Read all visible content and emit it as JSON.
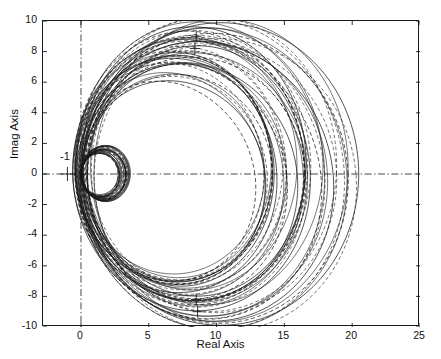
{
  "figure": {
    "kind": "nyquist-plot",
    "caption": ""
  },
  "axes": {
    "xlabel": "Real Axis",
    "ylabel": "Imag Axis",
    "xticks": [
      "0",
      "5",
      "10",
      "15",
      "20",
      "25"
    ],
    "xtick_values": [
      0,
      5,
      10,
      15,
      20,
      25
    ],
    "yticks": [
      "10",
      "8",
      "6",
      "4",
      "2",
      "0",
      "-2",
      "-4",
      "-6",
      "-8",
      "-10"
    ],
    "ytick_values": [
      10,
      8,
      6,
      4,
      2,
      0,
      -2,
      -4,
      -6,
      -8,
      -10
    ],
    "xlim": [
      -2.8,
      25
    ],
    "ylim": [
      -10,
      10
    ],
    "grid": false,
    "box": true
  },
  "annotations": {
    "critical_point_label": "-1",
    "critical_point": [
      -1,
      0
    ]
  },
  "colors": {
    "line": "#1a1a1a",
    "axis": "#1a1a1a",
    "background": "#ffffff"
  },
  "chart_data": {
    "type": "line",
    "title": "",
    "xlabel": "Real Axis",
    "ylabel": "Imag Axis",
    "xlim": [
      -2.8,
      25
    ],
    "ylim": [
      -10,
      10
    ],
    "grid": false,
    "legend": null,
    "annotations": [
      {
        "text": "-1",
        "x": -1,
        "y": 0,
        "marker": "plus"
      },
      {
        "marker": "plus",
        "x": 8.5,
        "y": 9.0
      },
      {
        "marker": "plus",
        "x": 8.4,
        "y": 8.2
      },
      {
        "marker": "plus",
        "x": 8.5,
        "y": -8.2
      },
      {
        "marker": "plus",
        "x": 8.6,
        "y": -9.0
      }
    ],
    "reference_lines": [
      {
        "orientation": "vertical",
        "value": 0,
        "style": "dashdot"
      },
      {
        "orientation": "horizontal",
        "value": 0,
        "style": "dashdot"
      }
    ],
    "note": "Family of Nyquist loci: large near-circular contours passing through the origin with right-hand crossings from ~14 to ~20 on the real axis, plus a tight cluster of small circles near the origin spanning real ~0 to ~3.6.",
    "series": [
      {
        "name": "locus-1",
        "style": "solid",
        "shape": "circle",
        "center": [
          10.0,
          0
        ],
        "radius": 10.0
      },
      {
        "name": "locus-2",
        "style": "dashed",
        "shape": "circle",
        "center": [
          9.6,
          0
        ],
        "radius": 9.6
      },
      {
        "name": "locus-3",
        "style": "solid",
        "shape": "circle",
        "center": [
          9.2,
          0
        ],
        "radius": 9.2
      },
      {
        "name": "locus-4",
        "style": "dashed",
        "shape": "circle",
        "center": [
          9.0,
          0
        ],
        "radius": 9.0
      },
      {
        "name": "locus-5",
        "style": "solid",
        "shape": "circle",
        "center": [
          8.8,
          0
        ],
        "radius": 8.8
      },
      {
        "name": "locus-6",
        "style": "dashed",
        "shape": "circle",
        "center": [
          8.6,
          0
        ],
        "radius": 8.6
      },
      {
        "name": "locus-7",
        "style": "solid",
        "shape": "circle",
        "center": [
          8.45,
          0
        ],
        "radius": 8.45
      },
      {
        "name": "locus-8",
        "style": "dashed",
        "shape": "circle",
        "center": [
          8.3,
          0
        ],
        "radius": 8.3
      },
      {
        "name": "locus-9",
        "style": "solid",
        "shape": "circle",
        "center": [
          8.15,
          0
        ],
        "radius": 8.15
      },
      {
        "name": "locus-10",
        "style": "dashed",
        "shape": "circle",
        "center": [
          8.0,
          0
        ],
        "radius": 8.0
      },
      {
        "name": "locus-11",
        "style": "solid",
        "shape": "circle",
        "center": [
          7.85,
          0
        ],
        "radius": 7.85
      },
      {
        "name": "locus-12",
        "style": "dashed",
        "shape": "circle",
        "center": [
          7.7,
          0
        ],
        "radius": 7.7
      },
      {
        "name": "locus-13",
        "style": "solid",
        "shape": "circle",
        "center": [
          7.55,
          0
        ],
        "radius": 7.55
      },
      {
        "name": "locus-14",
        "style": "dashed",
        "shape": "circle",
        "center": [
          7.4,
          0
        ],
        "radius": 7.4
      },
      {
        "name": "locus-15",
        "style": "solid",
        "shape": "circle",
        "center": [
          7.25,
          0
        ],
        "radius": 7.25
      },
      {
        "name": "locus-16",
        "style": "dashed",
        "shape": "circle",
        "center": [
          7.1,
          0
        ],
        "radius": 7.1
      },
      {
        "name": "locus-17",
        "style": "solid",
        "shape": "circle",
        "center": [
          6.95,
          0
        ],
        "radius": 6.95
      },
      {
        "name": "locus-18",
        "style": "dashed",
        "shape": "circle",
        "center": [
          6.8,
          0
        ],
        "radius": 6.8
      },
      {
        "name": "locus-19",
        "style": "solid",
        "shape": "circle",
        "center": [
          6.65,
          0
        ],
        "radius": 6.65
      },
      {
        "name": "locus-20",
        "style": "dashed",
        "shape": "circle",
        "center": [
          6.5,
          0
        ],
        "radius": 6.5
      },
      {
        "name": "inner-1",
        "style": "solid",
        "shape": "circle",
        "center": [
          1.8,
          0
        ],
        "radius": 1.8
      },
      {
        "name": "inner-2",
        "style": "solid",
        "shape": "circle",
        "center": [
          1.74,
          0
        ],
        "radius": 1.74
      },
      {
        "name": "inner-3",
        "style": "dashed",
        "shape": "circle",
        "center": [
          1.68,
          0
        ],
        "radius": 1.68
      },
      {
        "name": "inner-4",
        "style": "solid",
        "shape": "circle",
        "center": [
          1.62,
          0
        ],
        "radius": 1.62
      },
      {
        "name": "inner-5",
        "style": "dashed",
        "shape": "circle",
        "center": [
          1.56,
          0
        ],
        "radius": 1.56
      },
      {
        "name": "inner-6",
        "style": "solid",
        "shape": "circle",
        "center": [
          1.5,
          0
        ],
        "radius": 1.5
      },
      {
        "name": "inner-7",
        "style": "solid",
        "shape": "circle",
        "center": [
          1.44,
          0
        ],
        "radius": 1.44
      },
      {
        "name": "inner-8",
        "style": "dashed",
        "shape": "circle",
        "center": [
          1.38,
          0
        ],
        "radius": 1.38
      }
    ]
  }
}
